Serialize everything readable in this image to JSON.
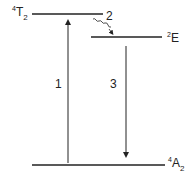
{
  "diagram": {
    "title": "",
    "levels": [
      {
        "id": "T2",
        "sup": "4",
        "base": "T",
        "sub": "2",
        "y": 14,
        "x1": 32,
        "x2": 103
      },
      {
        "id": "E",
        "sup": "2",
        "base": "E",
        "sub": "",
        "y": 37,
        "x1": 91,
        "x2": 162
      },
      {
        "id": "A2",
        "sup": "4",
        "base": "A",
        "sub": "2",
        "y": 165,
        "x1": 32,
        "x2": 165
      }
    ],
    "transitions": [
      {
        "label": "1",
        "type": "absorption",
        "direction": "up",
        "from": "A2",
        "to": "T2"
      },
      {
        "label": "2",
        "type": "non-radiative",
        "direction": "down",
        "from": "T2",
        "to": "E"
      },
      {
        "label": "3",
        "type": "emission",
        "direction": "down",
        "from": "E",
        "to": "A2"
      }
    ],
    "color": "#222222"
  }
}
